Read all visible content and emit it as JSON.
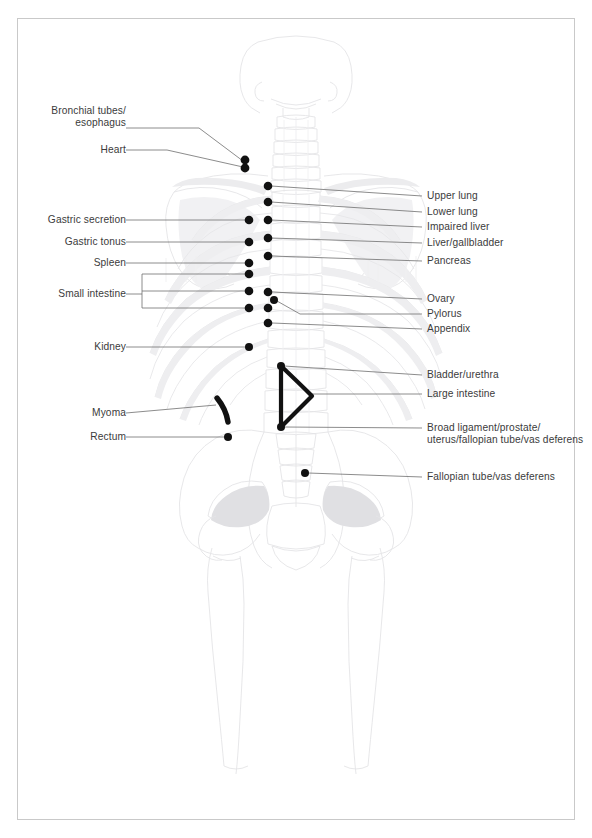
{
  "figure": {
    "type": "anatomical-diagram",
    "view": "posterior (back) view of human skeleton",
    "page_border_color": "#c9c9c9",
    "text_color": "#3b3b3b",
    "leader_line_color": "#6e6e6e",
    "marker_color": "#111111",
    "skeleton_line_color": "#e3e3e6",
    "skeleton_fill_color": "#ececee",
    "background_color": "#ffffff"
  },
  "labels_left": [
    {
      "id": "bronchial-tubes-esophagus",
      "line1": "Bronchial tubes/",
      "line2": "esophagus",
      "text_x": 120,
      "text_y": 111,
      "leader_y": 128,
      "target_x": 245,
      "target_y": 161
    },
    {
      "id": "heart",
      "line1": "Heart",
      "line2": "",
      "text_x": 120,
      "text_y": 144,
      "leader_y": 150,
      "target_x": 245,
      "target_y": 167
    },
    {
      "id": "gastric-secretion",
      "line1": "Gastric secretion",
      "line2": "",
      "text_x": 120,
      "text_y": 214,
      "leader_y": 220,
      "target_x": 249,
      "target_y": 220
    },
    {
      "id": "gastric-tonus",
      "line1": "Gastric tonus",
      "line2": "",
      "text_x": 120,
      "text_y": 236,
      "leader_y": 242,
      "target_x": 249,
      "target_y": 242
    },
    {
      "id": "spleen",
      "line1": "Spleen",
      "line2": "",
      "text_x": 120,
      "text_y": 257,
      "leader_y": 263,
      "target_x": 249,
      "target_y": 263
    },
    {
      "id": "small-intestine",
      "line1": "Small intestine",
      "line2": "",
      "text_x": 120,
      "text_y": 288,
      "leader_y": 294,
      "target_x": 249,
      "target_y": 294
    },
    {
      "id": "kidney",
      "line1": "Kidney",
      "line2": "",
      "text_x": 120,
      "text_y": 344,
      "leader_y": 347,
      "target_x": 249,
      "target_y": 347
    },
    {
      "id": "myoma",
      "line1": "Myoma",
      "line2": "",
      "text_x": 120,
      "text_y": 409,
      "leader_y": 413,
      "target_x": 222,
      "target_y": 413
    },
    {
      "id": "rectum",
      "line1": "Rectum",
      "line2": "",
      "text_x": 120,
      "text_y": 441,
      "leader_y": 437,
      "target_x": 228,
      "target_y": 437
    }
  ],
  "small_intestine_bracket": {
    "x": 142,
    "top_y": 274,
    "bottom_y": 308,
    "tip_x": 249,
    "rows": [
      274,
      291,
      308
    ]
  },
  "labels_right": [
    {
      "id": "upper-lung",
      "line1": "Upper lung",
      "line2": "",
      "text_x": 427,
      "text_y": 192,
      "leader_y": 196,
      "target_x": 268,
      "target_y": 186
    },
    {
      "id": "lower-lung",
      "line1": "Lower lung",
      "line2": "",
      "text_x": 427,
      "text_y": 208,
      "leader_y": 212,
      "target_x": 268,
      "target_y": 202
    },
    {
      "id": "impaired-liver",
      "line1": "Impaired liver",
      "line2": "",
      "text_x": 427,
      "text_y": 223,
      "leader_y": 227,
      "target_x": 268,
      "target_y": 220
    },
    {
      "id": "liver-gallbladder",
      "line1": "Liver/gallbladder",
      "line2": "",
      "text_x": 427,
      "text_y": 239,
      "leader_y": 243,
      "target_x": 268,
      "target_y": 238
    },
    {
      "id": "pancreas",
      "line1": "Pancreas",
      "line2": "",
      "text_x": 427,
      "text_y": 257,
      "leader_y": 261,
      "target_x": 268,
      "target_y": 256
    },
    {
      "id": "ovary",
      "line1": "Ovary",
      "line2": "",
      "text_x": 427,
      "text_y": 295,
      "leader_y": 299,
      "target_x": 269,
      "target_y": 292
    },
    {
      "id": "pylorus",
      "line1": "Pylorus",
      "line2": "",
      "text_x": 427,
      "text_y": 310,
      "leader_y": 314,
      "target_x": 273,
      "target_y": 299
    },
    {
      "id": "appendix",
      "line1": "Appendix",
      "line2": "",
      "text_x": 427,
      "text_y": 325,
      "leader_y": 329,
      "target_x": 269,
      "target_y": 323
    },
    {
      "id": "bladder-urethra",
      "line1": "Bladder/urethra",
      "line2": "",
      "text_x": 427,
      "text_y": 371,
      "leader_y": 375,
      "target_x": 281,
      "target_y": 366
    },
    {
      "id": "large-intestine",
      "line1": "Large intestine",
      "line2": "",
      "text_x": 427,
      "text_y": 390,
      "leader_y": 394,
      "target_x": 310,
      "target_y": 394
    },
    {
      "id": "broad-ligament",
      "line1": "Broad ligament/prostate/",
      "line2": "uterus/fallopian tube/vas deferens",
      "text_x": 427,
      "text_y": 424,
      "leader_y": 428,
      "target_x": 281,
      "target_y": 427
    },
    {
      "id": "fallopian-tube-vas-deferens",
      "line1": "Fallopian tube/vas deferens",
      "line2": "",
      "text_x": 427,
      "text_y": 476,
      "leader_y": 477,
      "target_x": 305,
      "target_y": 473
    }
  ],
  "markers": {
    "paired_double_dot": {
      "x": 245,
      "y1": 161,
      "y2": 168,
      "r": 4.2
    },
    "left_column_x": 249,
    "right_column_x": 268,
    "left_dots_y": [
      220,
      242,
      263,
      274,
      291,
      308,
      347
    ],
    "right_dots_y": [
      186,
      202,
      220,
      238,
      256,
      292,
      299,
      308,
      323
    ],
    "extra_dots": [
      {
        "id": "pylorus-offset-dot",
        "x": 274,
        "y": 300
      },
      {
        "id": "rectum-dot",
        "x": 228,
        "y": 437
      },
      {
        "id": "fallopian-dot",
        "x": 305,
        "y": 473
      },
      {
        "id": "bladder-top-dot",
        "x": 281,
        "y": 366
      },
      {
        "id": "broad-ligament-dot",
        "x": 281,
        "y": 427
      }
    ],
    "myoma_curve": {
      "x1": 218,
      "y1": 399,
      "x2": 228,
      "y2": 422,
      "width": 5
    },
    "large_intestine_triangle": {
      "apex_top": [
        281,
        366
      ],
      "apex_bottom": [
        281,
        427
      ],
      "point_right": [
        312,
        396
      ]
    }
  }
}
